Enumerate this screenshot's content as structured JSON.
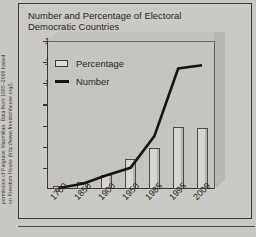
{
  "credit": {
    "line1": "permission of Palgrave Macmillan. Data from 1985–2009 based",
    "line2": "on Freedom House (http://www.freedomhouse.org/)."
  },
  "chart_data": {
    "type": "bar",
    "title": "Number and Percentage of Electoral Democratic Countries",
    "title_line1": "Number and Percentage of Electoral",
    "title_line2": "Democratic Countries",
    "xlabel": "",
    "ylabel": "",
    "ylim": [
      0,
      140
    ],
    "yticks": [
      0,
      20,
      40,
      60,
      80,
      100,
      120,
      140
    ],
    "ytick_labels": [
      "0",
      "20",
      "40",
      "60",
      "80",
      "100",
      "120",
      "140"
    ],
    "grid": false,
    "legend_position": "upper-left",
    "categories": [
      "1700",
      "1850",
      "1900",
      "1950",
      "1985",
      "1995",
      "2009"
    ],
    "series": [
      {
        "name": "Percentage",
        "type": "bar",
        "color": "#d7d5d1",
        "values": [
          3,
          7,
          13,
          28,
          39,
          59,
          58
        ]
      },
      {
        "name": "Number",
        "type": "line",
        "color": "#17150f",
        "values": [
          1,
          5,
          13,
          20,
          50,
          114,
          117
        ]
      }
    ]
  }
}
